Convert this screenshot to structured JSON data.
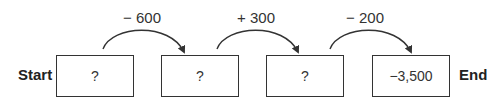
{
  "labels": {
    "start": "Start",
    "end": "End"
  },
  "boxes": [
    {
      "value": "?"
    },
    {
      "value": "?"
    },
    {
      "value": "?"
    },
    {
      "value": "−3,500"
    }
  ],
  "operations": [
    {
      "label": "− 600"
    },
    {
      "label": "+ 300"
    },
    {
      "label": "− 200"
    }
  ]
}
